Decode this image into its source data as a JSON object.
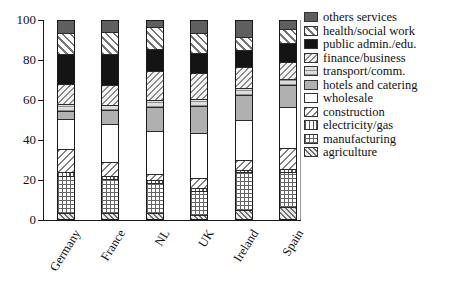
{
  "chart_data": {
    "type": "bar",
    "stacked": true,
    "orientation": "vertical",
    "categories": [
      "Germany",
      "France",
      "NL",
      "UK",
      "Ireland",
      "Spain"
    ],
    "series": [
      {
        "key": "agriculture",
        "name": "agriculture",
        "pattern": "diagonal-hatch-fine",
        "color": "#6e6e6e",
        "values": [
          3,
          3,
          3,
          2,
          4.5,
          6
        ]
      },
      {
        "key": "manufacturing",
        "name": "manufacturing",
        "pattern": "grid-crosshatch",
        "color": "#666666",
        "values": [
          18.5,
          17,
          15,
          12,
          19,
          18
        ]
      },
      {
        "key": "electricity_gas",
        "name": "electricity/gas",
        "pattern": "vertical-stripes",
        "color": "#555555",
        "values": [
          2,
          1.5,
          1.5,
          1.5,
          1.5,
          1.5
        ]
      },
      {
        "key": "construction",
        "name": "construction",
        "pattern": "diagonal-hatch-up",
        "color": "#808080",
        "values": [
          12,
          7.5,
          3,
          5,
          5,
          10.5
        ]
      },
      {
        "key": "wholesale",
        "name": "wholesale",
        "pattern": "solid",
        "color": "#ffffff",
        "values": [
          15,
          19,
          22,
          23,
          20,
          20.5
        ]
      },
      {
        "key": "hotels_catering",
        "name": "hotels and catering",
        "pattern": "solid",
        "color": "#b0b0b0",
        "values": [
          4,
          7,
          12,
          13.5,
          12.5,
          11
        ]
      },
      {
        "key": "transport_comm",
        "name": "transport/comm.",
        "pattern": "horizontal-stripes",
        "color": "#8f8f8f",
        "values": [
          3.5,
          2.5,
          3.5,
          3.5,
          3.5,
          3
        ]
      },
      {
        "key": "finance_business",
        "name": "finance/business",
        "pattern": "diagonal-hatch-up-fine",
        "color": "#8c8c8c",
        "values": [
          10,
          10,
          15,
          13,
          11,
          9
        ]
      },
      {
        "key": "public_admin_edu",
        "name": "public admin./edu.",
        "pattern": "solid",
        "color": "#141414",
        "values": [
          15.5,
          16,
          11,
          10.5,
          8.5,
          9.5
        ]
      },
      {
        "key": "health_social",
        "name": "health/social work",
        "pattern": "diagonal-hatch-down",
        "color": "#777777",
        "values": [
          10.5,
          11,
          11,
          10,
          6.5,
          7
        ]
      },
      {
        "key": "others_services",
        "name": "others services",
        "pattern": "solid",
        "color": "#5f5f5f",
        "values": [
          6,
          5.5,
          3,
          6,
          8,
          4
        ]
      }
    ],
    "ylim": [
      0,
      100
    ],
    "yticks": [
      0,
      20,
      40,
      60,
      80,
      100
    ],
    "xlabel": "",
    "ylabel": "",
    "title": "",
    "grid": false,
    "legend_position": "right",
    "legend_order_top_to_bottom": [
      "others services",
      "health/social work",
      "public admin./edu.",
      "finance/business",
      "transport/comm.",
      "hotels and catering",
      "wholesale",
      "construction",
      "electricity/gas",
      "manufacturing",
      "agriculture"
    ]
  }
}
